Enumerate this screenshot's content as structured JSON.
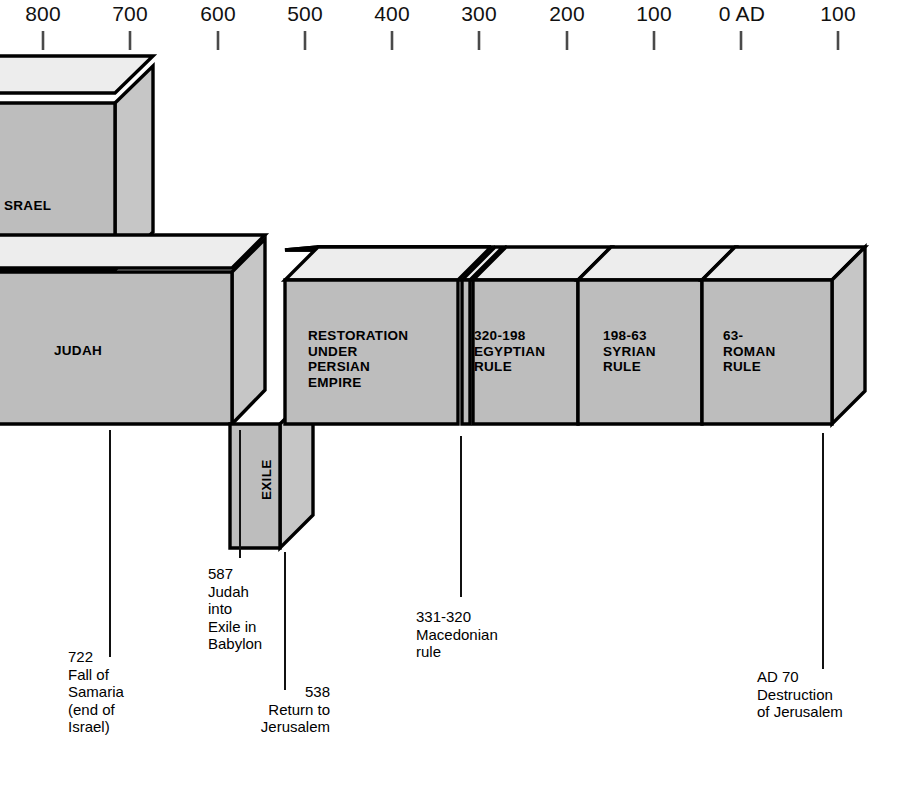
{
  "figure": {
    "kind": "historical-timeline-diagram",
    "orientation": "left-to-right, BC decreasing to AD increasing"
  },
  "axis": {
    "name": "year-scale",
    "ticks": [
      {
        "label": "800",
        "x": 43,
        "tick_x": 43
      },
      {
        "label": "700",
        "x": 130,
        "tick_x": 130
      },
      {
        "label": "600",
        "x": 218,
        "tick_x": 218
      },
      {
        "label": "500",
        "x": 305,
        "tick_x": 305
      },
      {
        "label": "400",
        "x": 392,
        "tick_x": 392
      },
      {
        "label": "300",
        "x": 479,
        "tick_x": 479
      },
      {
        "label": "200",
        "x": 567,
        "tick_x": 567
      },
      {
        "label": "100",
        "x": 654,
        "tick_x": 654
      },
      {
        "label": "0 AD",
        "x": 742,
        "tick_x": 741
      },
      {
        "label": "100",
        "x": 838,
        "tick_x": 838
      }
    ]
  },
  "blocks": [
    {
      "name": "israel-block",
      "label": "SRAEL",
      "label_x": 4,
      "label_y": 198,
      "note": "clipped at left edge of image; full word is ISRAEL"
    },
    {
      "name": "judah-block",
      "label": "JUDAH",
      "label_x": 54,
      "label_y": 343
    },
    {
      "name": "exile-block",
      "label": "EXILE",
      "label_x": 259,
      "label_y": 500,
      "orientation": "vertical"
    },
    {
      "name": "restoration-block",
      "label": "RESTORATION\nUNDER\nPERSIAN\nEMPIRE",
      "label_x": 308,
      "label_y": 328
    },
    {
      "name": "egyptian-rule-block",
      "label": "320-198\nEGYPTIAN\nRULE",
      "label_x": 474,
      "label_y": 328
    },
    {
      "name": "syrian-rule-block",
      "label": "198-63\nSYRIAN\nRULE",
      "label_x": 603,
      "label_y": 328
    },
    {
      "name": "roman-rule-block",
      "label": "63-\nROMAN\nRULE",
      "label_x": 723,
      "label_y": 328
    },
    {
      "name": "macedonian-sliver-block",
      "label": "",
      "note": "narrow unlabeled segment between Restoration and Egyptian rule"
    }
  ],
  "annotations": [
    {
      "name": "annotation-fall-of-samaria",
      "text": "722\nFall of\nSamaria\n(end of\nIsrael)",
      "text_x": 68,
      "text_y": 648,
      "align": "left",
      "leader": {
        "x": 110,
        "y1": 430,
        "y2": 657
      }
    },
    {
      "name": "annotation-judah-into-exile",
      "text": "587\nJudah\ninto\nExile in\nBabylon",
      "text_x": 208,
      "text_y": 565,
      "align": "left",
      "leader": {
        "x": 240,
        "y1": 430,
        "y2": 558
      }
    },
    {
      "name": "annotation-return-to-jerusalem",
      "text": "538\nReturn to\nJerusalem",
      "text_x": 330,
      "text_y": 683,
      "align": "right",
      "leader": {
        "x": 285,
        "y1": 552,
        "y2": 690
      }
    },
    {
      "name": "annotation-macedonian-rule",
      "text": "331-320\nMacedonian\nrule",
      "text_x": 416,
      "text_y": 608,
      "align": "left",
      "leader": {
        "x": 461,
        "y1": 436,
        "y2": 597
      }
    },
    {
      "name": "annotation-destruction-of-jerusalem",
      "text": "AD 70\nDestruction\nof Jerusalem",
      "text_x": 757,
      "text_y": 668,
      "align": "left",
      "leader": {
        "x": 823,
        "y1": 433,
        "y2": 669
      }
    }
  ],
  "colors": {
    "background": "#ffffff",
    "block_front": "#bdbdbd",
    "block_top": "#ededed",
    "block_side": "#c6c6c6",
    "outline": "#000000",
    "text": "#000000",
    "tick": "#555555"
  }
}
